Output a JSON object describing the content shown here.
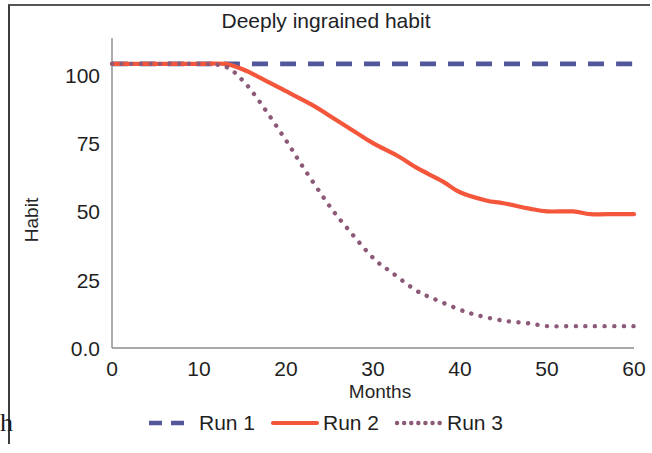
{
  "chart_data": {
    "type": "line",
    "title": "Deeply ingrained habit",
    "xlabel": "Months",
    "ylabel": "Habit",
    "xlim": [
      0,
      60
    ],
    "ylim": [
      0,
      112
    ],
    "grid": false,
    "legend_position": "bottom",
    "xticks": [
      "0",
      "10",
      "20",
      "30",
      "40",
      "50",
      "60"
    ],
    "xtick_values": [
      0,
      10,
      20,
      30,
      40,
      50,
      60
    ],
    "yticks": [
      "0.0",
      "25",
      "50",
      "75",
      "100"
    ],
    "ytick_values": [
      0,
      25,
      50,
      75,
      100
    ],
    "series": [
      {
        "name": "Run 1",
        "color": "#53569B",
        "style": "dashed",
        "x": [
          0,
          5,
          10,
          13,
          15,
          20,
          25,
          30,
          35,
          40,
          45,
          50,
          55,
          60
        ],
        "values": [
          104,
          104,
          104,
          104,
          104,
          104,
          104,
          104,
          104,
          104,
          104,
          104,
          104,
          104
        ]
      },
      {
        "name": "Run 2",
        "color": "#F4563B",
        "style": "solid",
        "x": [
          0,
          5,
          10,
          13,
          15,
          17,
          20,
          23,
          25,
          28,
          30,
          33,
          35,
          38,
          40,
          43,
          45,
          48,
          50,
          53,
          55,
          58,
          60
        ],
        "values": [
          104,
          104,
          104,
          104,
          102,
          99,
          94,
          89,
          85,
          79,
          75,
          70,
          66,
          61,
          57,
          54,
          53,
          51,
          50,
          50,
          49,
          49,
          49
        ]
      },
      {
        "name": "Run 3",
        "color": "#8C5A78",
        "style": "dotted",
        "x": [
          0,
          5,
          10,
          13,
          15,
          17,
          20,
          22,
          25,
          27,
          30,
          32,
          35,
          37,
          40,
          42,
          45,
          48,
          50,
          53,
          55,
          58,
          60
        ],
        "values": [
          104,
          104,
          104,
          103,
          98,
          90,
          76,
          66,
          52,
          44,
          33,
          28,
          21,
          18,
          14,
          12,
          10,
          9,
          8,
          8,
          8,
          8,
          8
        ]
      }
    ]
  },
  "artifact": {
    "corner_glyph": "h"
  }
}
